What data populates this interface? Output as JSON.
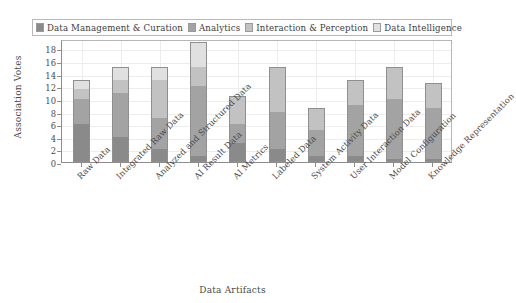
{
  "chart_data": {
    "type": "bar",
    "stacked": true,
    "title": "",
    "xlabel": "Data Artifacts",
    "ylabel": "Association Votes",
    "ylim": [
      0,
      19.5
    ],
    "yticks": [
      0,
      2,
      4,
      6,
      8,
      10,
      12,
      14,
      16,
      18
    ],
    "grid": true,
    "legend_position": "top",
    "categories": [
      "Raw Data",
      "Integrated Raw Data",
      "Analyzed and Structured Data",
      "AI Result Data",
      "AI Metrics",
      "Labeled Data",
      "System Activity Data",
      "User Interaction Data",
      "Model Configuration",
      "Knowledge Representation"
    ],
    "series": [
      {
        "name": "Data Management & Curation",
        "color": "#8a8a8a",
        "values": [
          6,
          4,
          2,
          1,
          3,
          2,
          1,
          1,
          0.5,
          0.5
        ]
      },
      {
        "name": "Analytics",
        "color": "#a3a3a3",
        "values": [
          4,
          7,
          5,
          11,
          3,
          6,
          4,
          8,
          9.5,
          8
        ]
      },
      {
        "name": "Interaction & Perception",
        "color": "#c2c2c2",
        "values": [
          1.5,
          2,
          6,
          3,
          4.5,
          7,
          3.5,
          4,
          5,
          4
        ]
      },
      {
        "name": "Data Intelligence",
        "color": "#e0e0e0",
        "values": [
          1.5,
          2,
          2,
          4,
          0,
          0,
          0,
          0,
          0,
          0
        ]
      }
    ],
    "totals": [
      13,
      15,
      15,
      19,
      10.5,
      15,
      8.5,
      13,
      15,
      12.5
    ]
  },
  "legend": {
    "entries": [
      {
        "label": "Data Management & Curation",
        "color": "#8a8a8a"
      },
      {
        "label": "Analytics",
        "color": "#a3a3a3"
      },
      {
        "label": "Interaction & Perception",
        "color": "#c2c2c2"
      },
      {
        "label": "Data Intelligence",
        "color": "#e0e0e0"
      }
    ]
  },
  "axes": {
    "y_title": "Association Votes",
    "x_title": "Data Artifacts",
    "y_tick_labels": [
      "0",
      "2",
      "4",
      "6",
      "8",
      "10",
      "12",
      "14",
      "16",
      "18"
    ]
  }
}
